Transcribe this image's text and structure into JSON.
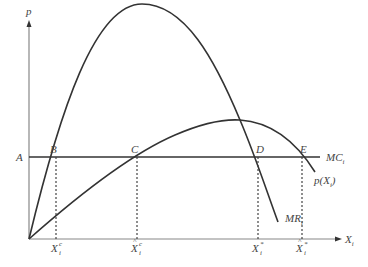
{
  "diagram": {
    "y_axis_label": "p",
    "x_axis_label": "X",
    "x_axis_label_sub": "i",
    "price_level_label": "A",
    "points": {
      "B": "B",
      "C": "C",
      "D": "D",
      "E": "E"
    },
    "curves": {
      "mc_label": "MC",
      "mc_label_sub": "i",
      "demand_label": "p(X",
      "demand_label_sub": "i",
      "demand_label_close": ")",
      "mr_label": "MR",
      "mr_label_sub": "i"
    },
    "x_ticks": [
      {
        "base": "X",
        "sup": "c",
        "sub": "i",
        "hat": false
      },
      {
        "base": "X",
        "sup": "c",
        "sub": "i",
        "hat": true
      },
      {
        "base": "X",
        "sup": "*",
        "sub": "i",
        "hat": false
      },
      {
        "base": "X",
        "sup": "*",
        "sub": "i",
        "hat": true
      }
    ],
    "colors": {
      "axis": "#888888",
      "curve": "#333333",
      "text": "#444444"
    }
  }
}
